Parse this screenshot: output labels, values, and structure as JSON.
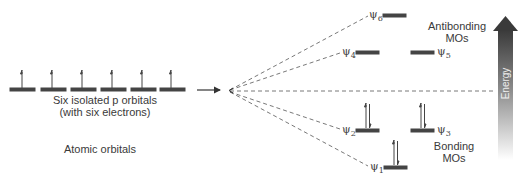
{
  "diagram": {
    "atomic": {
      "caption_line1": "Six isolated p orbitals",
      "caption_line2": "(with six electrons)",
      "section_label": "Atomic orbitals",
      "orbital_count": 6,
      "electrons_per_orbital": 1
    },
    "molecular": {
      "orbitals": [
        {
          "name": "ψ1",
          "sym": "ψ",
          "sub": "1",
          "electrons": 2,
          "type": "bonding"
        },
        {
          "name": "ψ2",
          "sym": "ψ",
          "sub": "2",
          "electrons": 2,
          "type": "bonding"
        },
        {
          "name": "ψ3",
          "sym": "ψ",
          "sub": "3",
          "electrons": 2,
          "type": "bonding"
        },
        {
          "name": "ψ4",
          "sym": "ψ",
          "sub": "4",
          "electrons": 0,
          "type": "antibonding"
        },
        {
          "name": "ψ5",
          "sym": "ψ",
          "sub": "5",
          "electrons": 0,
          "type": "antibonding"
        },
        {
          "name": "ψ6",
          "sym": "ψ",
          "sub": "6",
          "electrons": 0,
          "type": "antibonding"
        }
      ],
      "antibonding_label_line1": "Antibonding",
      "antibonding_label_line2": "MOs",
      "bonding_label_line1": "Bonding",
      "bonding_label_line2": "MOs"
    },
    "energy_axis_label": "Energy",
    "colors": {
      "line": "#444444",
      "energy_arrow_top": "#3a3a3a",
      "energy_arrow_bottom": "#ffffff"
    }
  }
}
